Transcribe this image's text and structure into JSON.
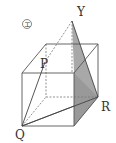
{
  "figure": {
    "marker": "エ",
    "labels": {
      "Y": "Y",
      "P": "P",
      "Q": "Q",
      "R": "R"
    },
    "colors": {
      "line": "#555555",
      "shade": "#a8a8a8",
      "dashed": "#777777"
    }
  }
}
